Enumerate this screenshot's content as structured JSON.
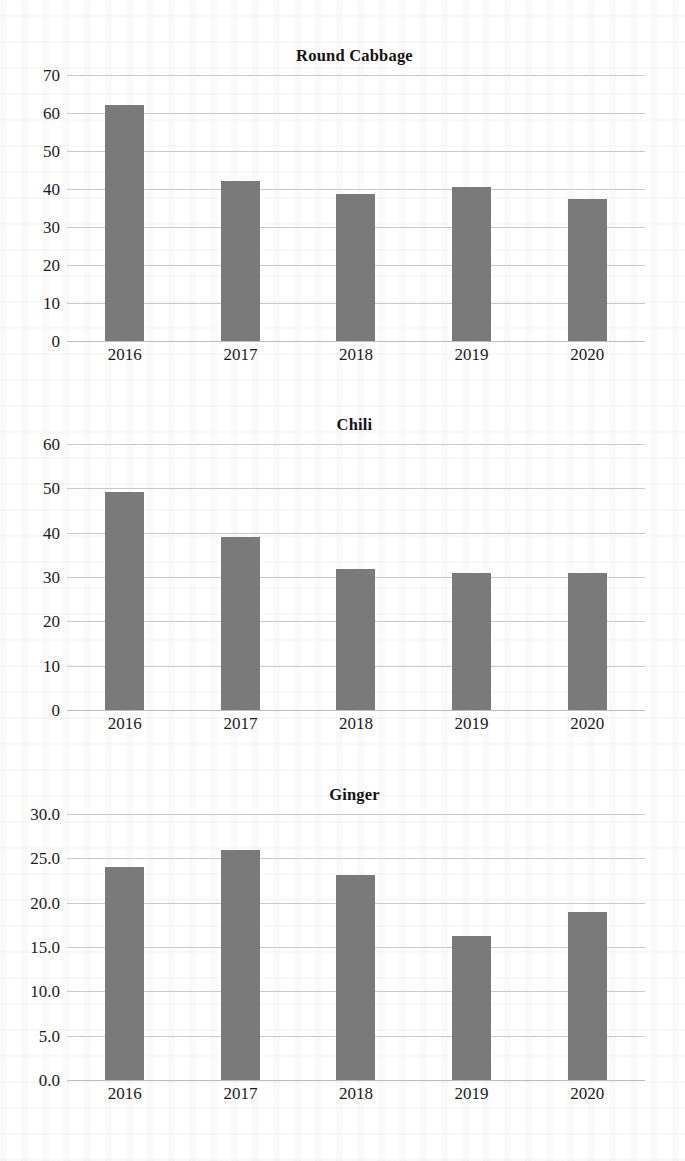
{
  "page": {
    "background_color": "#ffffff",
    "bar_color": "#7a7a7a",
    "gridline_color": "#c9c9c9",
    "text_color": "#1b1b1b"
  },
  "chart_data": [
    {
      "type": "bar",
      "title": "Round Cabbage",
      "xlabel": "",
      "ylabel": "",
      "categories": [
        "2016",
        "2017",
        "2018",
        "2019",
        "2020"
      ],
      "values": [
        62.0,
        42.2,
        38.6,
        40.4,
        37.4
      ],
      "ytick_labels": [
        "70",
        "60",
        "50",
        "40",
        "30",
        "20",
        "10",
        "0"
      ],
      "yticks": [
        70,
        60,
        50,
        40,
        30,
        20,
        10,
        0
      ],
      "ylim": [
        0,
        70
      ],
      "grid": true,
      "legend": "none"
    },
    {
      "type": "bar",
      "title": "Chili",
      "xlabel": "",
      "ylabel": "",
      "categories": [
        "2016",
        "2017",
        "2018",
        "2019",
        "2020"
      ],
      "values": [
        49.2,
        39.0,
        31.7,
        30.8,
        30.9
      ],
      "ytick_labels": [
        "60",
        "50",
        "40",
        "30",
        "20",
        "10",
        "0"
      ],
      "yticks": [
        60,
        50,
        40,
        30,
        20,
        10,
        0
      ],
      "ylim": [
        0,
        60
      ],
      "grid": true,
      "legend": "none"
    },
    {
      "type": "bar",
      "title": "Ginger",
      "xlabel": "",
      "ylabel": "",
      "categories": [
        "2016",
        "2017",
        "2018",
        "2019",
        "2020"
      ],
      "values": [
        24.0,
        25.9,
        23.1,
        16.2,
        19.0
      ],
      "ytick_labels": [
        "30.0",
        "25.0",
        "20.0",
        "15.0",
        "10.0",
        "5.0",
        "0.0"
      ],
      "yticks": [
        30,
        25,
        20,
        15,
        10,
        5,
        0
      ],
      "ylim": [
        0,
        30
      ],
      "grid": true,
      "legend": "none"
    }
  ]
}
